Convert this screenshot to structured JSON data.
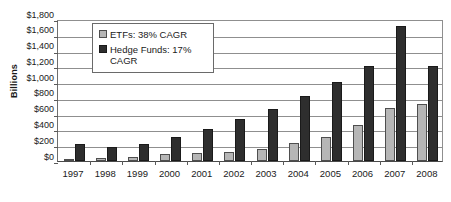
{
  "chart_data": {
    "type": "bar",
    "title": "",
    "subtitle": "",
    "xlabel": "",
    "ylabel": "Billions",
    "ylim": [
      0,
      1800
    ],
    "ytick_step": 200,
    "ytick_labels": [
      "$0",
      "$200",
      "$400",
      "$600",
      "$800",
      "$1,000",
      "$1,200",
      "$1,400",
      "$1,600",
      "$1,800"
    ],
    "grid": true,
    "legend_position": "upper-left-inside",
    "categories": [
      "1997",
      "1998",
      "1999",
      "2000",
      "2001",
      "2002",
      "2003",
      "2004",
      "2005",
      "2006",
      "2007",
      "2008"
    ],
    "series": [
      {
        "name": "ETFs: 38% CAGR",
        "short_name": "ETFs",
        "color": "#b6b6b6",
        "values": [
          25,
          35,
          50,
          90,
          105,
          115,
          155,
          230,
          305,
          455,
          670,
          720
        ]
      },
      {
        "name": "Hedge Funds: 17% CAGR",
        "short_name": "Hedge Funds",
        "color": "#2e2e2e",
        "values": [
          210,
          180,
          220,
          300,
          410,
          535,
          655,
          825,
          1000,
          1200,
          1710,
          1200
        ]
      }
    ]
  },
  "legend": {
    "entries": [
      {
        "label": "ETFs: 38% CAGR",
        "swatch": "series-etf"
      },
      {
        "label": "Hedge Funds: 17% CAGR",
        "swatch": "series-hf"
      }
    ]
  },
  "axis": {
    "y_title": "Billions"
  }
}
